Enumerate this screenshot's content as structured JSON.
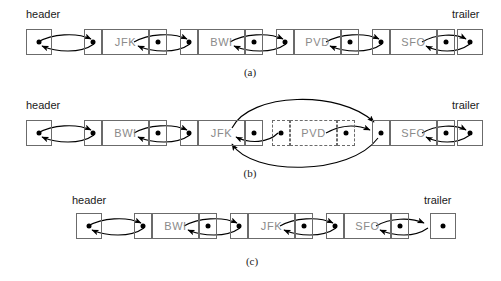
{
  "figure": {
    "caption_a": "(a)",
    "caption_b": "(b)",
    "caption_c": "(c)",
    "header_label": "header",
    "trailer_label": "trailer",
    "colors": {
      "background": "#ffffff",
      "box_border": "#6b6b6b",
      "node_label": "#8a8a8a",
      "end_label": "#1a1a1a",
      "arrow": "#000000",
      "caption": "#222222"
    }
  },
  "rows": [
    {
      "id": "row-a",
      "caption": "(a)",
      "header": "header",
      "trailer": "trailer",
      "nodes": [
        {
          "label": "JFK"
        },
        {
          "label": "BWI"
        },
        {
          "label": "PVD"
        },
        {
          "label": "SFO"
        }
      ],
      "removed": null
    },
    {
      "id": "row-b",
      "caption": "(b)",
      "header": "header",
      "trailer": "trailer",
      "nodes": [
        {
          "label": "BWI"
        },
        {
          "label": "JFK"
        },
        {
          "label": "PVD",
          "dashed": "true"
        },
        {
          "label": "SFO"
        }
      ],
      "removed": "PVD"
    },
    {
      "id": "row-c",
      "caption": "(c)",
      "header": "header",
      "trailer": "trailer",
      "nodes": [
        {
          "label": "BWI"
        },
        {
          "label": "JFK"
        },
        {
          "label": "SFO"
        }
      ],
      "removed": null
    }
  ]
}
